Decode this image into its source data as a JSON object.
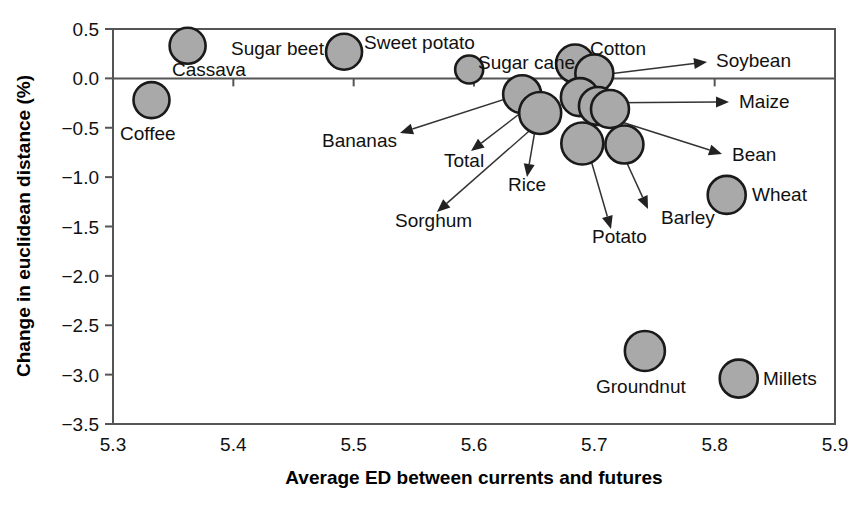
{
  "chart_data": {
    "type": "scatter",
    "title": "",
    "xlabel": "Average ED between currents and futures",
    "ylabel": "Change in euclidean distance (%)",
    "xlim": [
      5.3,
      5.9
    ],
    "ylim": [
      -3.5,
      0.5
    ],
    "xticks": [
      "5.3",
      "5.4",
      "5.5",
      "5.6",
      "5.7",
      "5.8",
      "5.9"
    ],
    "xtick_values": [
      5.3,
      5.4,
      5.5,
      5.6,
      5.7,
      5.8,
      5.9
    ],
    "yticks": [
      "0.5",
      "0.0",
      "-0.5",
      "-1.0",
      "-1.5",
      "-2.0",
      "-2.5",
      "-3.0",
      "-3.5"
    ],
    "ytick_values": [
      0.5,
      0.0,
      -0.5,
      -1.0,
      -1.5,
      -2.0,
      -2.5,
      -3.0,
      -3.5
    ],
    "grid": false,
    "legend": "none",
    "marker_fill": "#a9a9a9",
    "marker_edge": "#1a1a1a",
    "reference_line_y": 0.0,
    "points": [
      {
        "name": "Cassava",
        "x": 5.362,
        "y": 0.33,
        "r": 18
      },
      {
        "name": "Coffee",
        "x": 5.332,
        "y": -0.22,
        "r": 18
      },
      {
        "name": "Sugar beet",
        "x": 5.492,
        "y": 0.27,
        "r": 18
      },
      {
        "name": "Sweet potato",
        "x": 5.596,
        "y": 0.09,
        "r": 14
      },
      {
        "name": "Sugar cane",
        "x": 5.684,
        "y": 0.15,
        "r": 19
      },
      {
        "name": "Cotton",
        "x": 5.7,
        "y": 0.05,
        "r": 19
      },
      {
        "name": "Soybean",
        "x": 5.688,
        "y": -0.19,
        "r": 19
      },
      {
        "name": "Bananas",
        "x": 5.64,
        "y": -0.16,
        "r": 19
      },
      {
        "name": "Total",
        "x": 5.655,
        "y": -0.35,
        "r": 21
      },
      {
        "name": "Sorghum",
        "x": 5.703,
        "y": -0.28,
        "r": 19
      },
      {
        "name": "Rice",
        "x": 5.713,
        "y": -0.31,
        "r": 19
      },
      {
        "name": "Maize",
        "x": 5.69,
        "y": -0.66,
        "r": 21
      },
      {
        "name": "Barley",
        "x": 5.725,
        "y": -0.67,
        "r": 19
      },
      {
        "name": "Bean",
        "x": 5.81,
        "y": -1.18,
        "r": 19
      },
      {
        "name": "Potato",
        "x": 5.742,
        "y": -2.76,
        "r": 20
      },
      {
        "name": "Millets",
        "x": 5.82,
        "y": -3.04,
        "r": 19
      }
    ],
    "labels": [
      {
        "text": "Cassava",
        "x": 172,
        "y": 76,
        "anchor": "start",
        "callout": false
      },
      {
        "text": "Sugar beet",
        "x": 231,
        "y": 55,
        "anchor": "start",
        "callout": false
      },
      {
        "text": "Sweet potato",
        "x": 364,
        "y": 49,
        "anchor": "start",
        "callout": false
      },
      {
        "text": "Sugar cane",
        "x": 478,
        "y": 69,
        "anchor": "start",
        "callout": false
      },
      {
        "text": "Cotton",
        "x": 590,
        "y": 55,
        "anchor": "start",
        "callout": false
      },
      {
        "text": "Coffee",
        "x": 120,
        "y": 140,
        "anchor": "start",
        "callout": false
      },
      {
        "text": "Wheat",
        "x": 752,
        "y": 201,
        "anchor": "start",
        "callout": false
      },
      {
        "text": "Groundnut",
        "x": 596,
        "y": 393,
        "anchor": "start",
        "callout": false
      },
      {
        "text": "Millets",
        "x": 763,
        "y": 385,
        "anchor": "start",
        "callout": false
      },
      {
        "text": "Soybean",
        "x": 716,
        "y": 67,
        "anchor": "start",
        "callout": true
      },
      {
        "text": "Maize",
        "x": 739,
        "y": 108,
        "anchor": "start",
        "callout": true
      },
      {
        "text": "Bean",
        "x": 732,
        "y": 161,
        "anchor": "start",
        "callout": true
      },
      {
        "text": "Bananas",
        "x": 322,
        "y": 147,
        "anchor": "start",
        "callout": true
      },
      {
        "text": "Total",
        "x": 444,
        "y": 167,
        "anchor": "start",
        "callout": true
      },
      {
        "text": "Rice",
        "x": 508,
        "y": 191,
        "anchor": "start",
        "callout": true
      },
      {
        "text": "Sorghum",
        "x": 395,
        "y": 227,
        "anchor": "start",
        "callout": true
      },
      {
        "text": "Potato",
        "x": 592,
        "y": 243,
        "anchor": "start",
        "callout": true
      },
      {
        "text": "Barley",
        "x": 661,
        "y": 224,
        "anchor": "start",
        "callout": true
      }
    ],
    "callouts": [
      {
        "name": "soybean",
        "x1": 576,
        "y1": 78,
        "x2": 707,
        "y2": 62
      },
      {
        "name": "maize",
        "x1": 580,
        "y1": 103,
        "x2": 729,
        "y2": 102
      },
      {
        "name": "bean",
        "x1": 609,
        "y1": 118,
        "x2": 722,
        "y2": 154
      },
      {
        "name": "bananas",
        "x1": 524,
        "y1": 93,
        "x2": 400,
        "y2": 133
      },
      {
        "name": "total",
        "x1": 531,
        "y1": 105,
        "x2": 471,
        "y2": 151
      },
      {
        "name": "rice",
        "x1": 539,
        "y1": 107,
        "x2": 527,
        "y2": 177
      },
      {
        "name": "sorghum",
        "x1": 544,
        "y1": 118,
        "x2": 437,
        "y2": 212
      },
      {
        "name": "potato",
        "x1": 588,
        "y1": 150,
        "x2": 611,
        "y2": 229
      },
      {
        "name": "barley",
        "x1": 621,
        "y1": 150,
        "x2": 648,
        "y2": 209
      }
    ]
  },
  "axes": {
    "xlabel": "Average ED between currents and futures",
    "ylabel": "Change in euclidean distance (%)"
  }
}
